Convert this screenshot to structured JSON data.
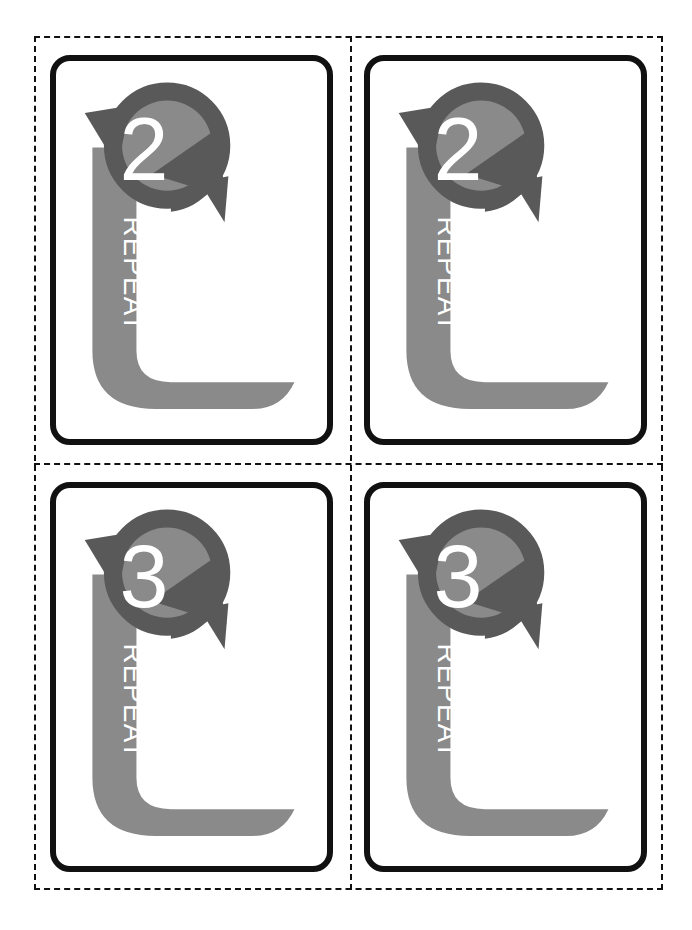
{
  "page": {
    "background_color": "#ffffff",
    "width": 692,
    "height": 930
  },
  "cut_lines": {
    "name": "dashed-cut-guides",
    "color": "#111111",
    "style": "dashed",
    "thickness_px": 2,
    "vertical_positions": [
      350
    ],
    "horizontal_positions": [
      463
    ]
  },
  "colors": {
    "card_border": "#111111",
    "card_background": "#ffffff",
    "arrow_dark_gray": "#595959",
    "arrow_light_gray": "#8a8a8a",
    "banner_gray": "#8a8a8a",
    "label_text": "#ffffff",
    "number_text": "#ffffff"
  },
  "card_template": {
    "icon_name": "circular-repeat-arrows-icon",
    "label": "REPEAT",
    "label_orientation": "rotated-90-clockwise",
    "banner_shape": "l-shaped-ribbon-with-swoosh-tail"
  },
  "cards": [
    {
      "id": "card-repeat-2-left",
      "row": 1,
      "column": 1,
      "number": "2",
      "label": "REPEAT"
    },
    {
      "id": "card-repeat-2-right",
      "row": 1,
      "column": 2,
      "number": "2",
      "label": "REPEAT"
    },
    {
      "id": "card-repeat-3-left",
      "row": 2,
      "column": 1,
      "number": "3",
      "label": "REPEAT"
    },
    {
      "id": "card-repeat-3-right",
      "row": 2,
      "column": 2,
      "number": "3",
      "label": "REPEAT"
    }
  ]
}
